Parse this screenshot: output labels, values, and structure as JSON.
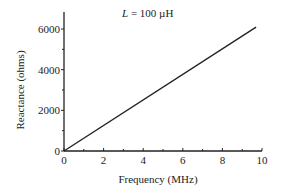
{
  "chart_data": {
    "type": "line",
    "title": "L = 100 µH",
    "title_var": "L",
    "title_rest": " = 100 µH",
    "xlabel": "Frequency (MHz)",
    "ylabel": "Reactance (ohms)",
    "xlim": [
      0,
      10
    ],
    "ylim": [
      0,
      7000
    ],
    "xticks": [
      "0",
      "2",
      "4",
      "6",
      "8",
      "10"
    ],
    "yticks": [
      "0",
      "2000",
      "4000",
      "6000"
    ],
    "grid": false,
    "series": [
      {
        "name": "Inductive reactance",
        "x": [
          0,
          9.7
        ],
        "y": [
          0,
          6095
        ]
      }
    ],
    "color": "#222222"
  }
}
